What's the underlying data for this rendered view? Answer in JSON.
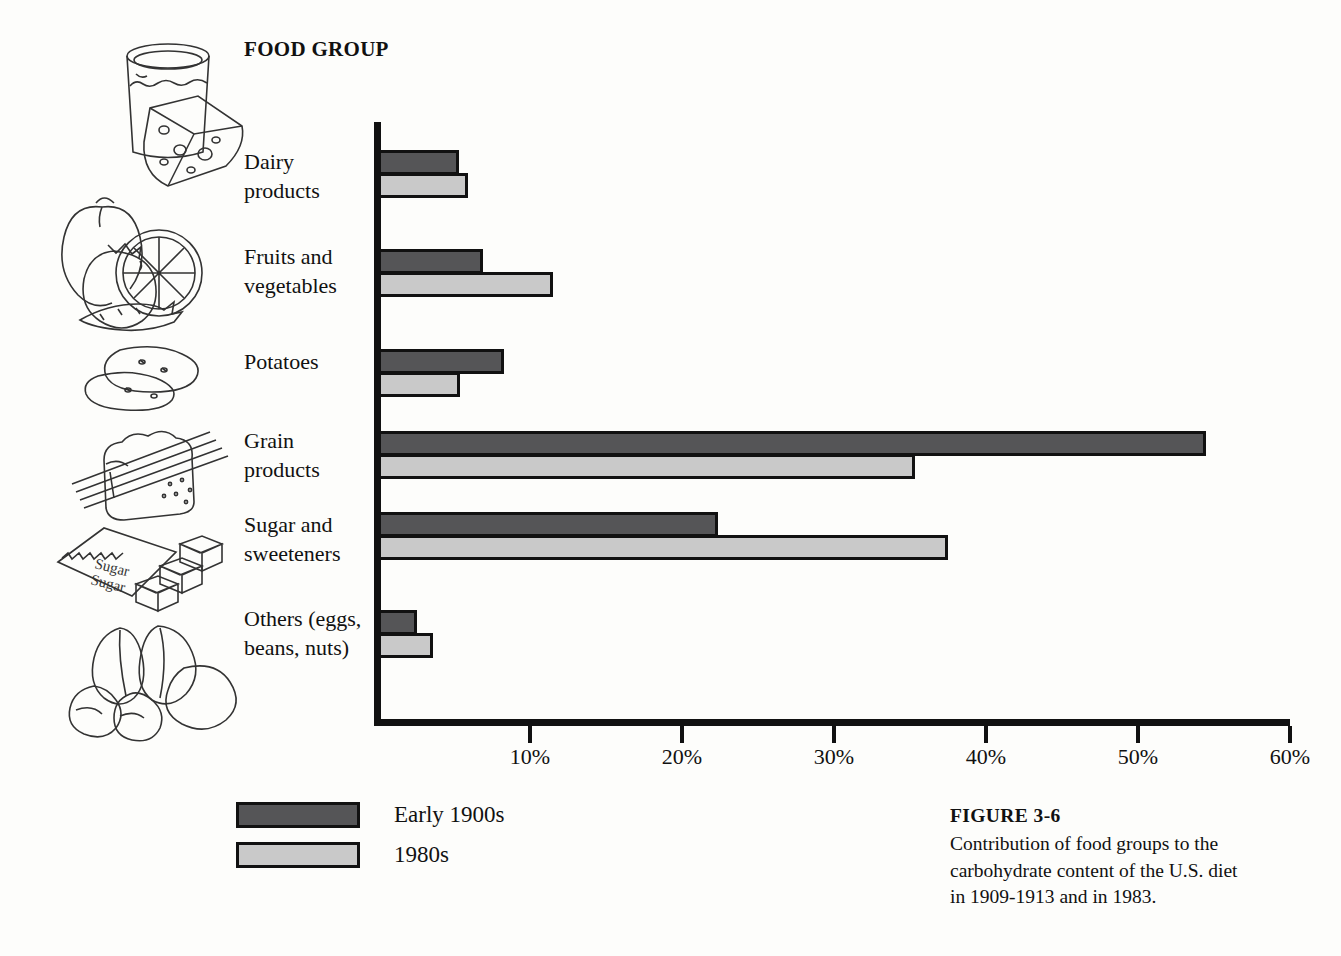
{
  "figure": {
    "number_label": "FIGURE 3-6",
    "caption": "Contribution of food groups to the carbohydrate content of the U.S. diet in 1909-1913 and in 1983."
  },
  "headings": {
    "food_group": "FOOD\nGROUP"
  },
  "axis": {
    "ticks": [
      {
        "value": 10,
        "label": "10%"
      },
      {
        "value": 20,
        "label": "20%"
      },
      {
        "value": 30,
        "label": "30%"
      },
      {
        "value": 40,
        "label": "40%"
      },
      {
        "value": 50,
        "label": "50%"
      },
      {
        "value": 60,
        "label": "60%"
      }
    ]
  },
  "legend": {
    "items": [
      {
        "label": "Early 1900s",
        "color": "#555557",
        "key": "early"
      },
      {
        "label": "1980s",
        "color": "#c9c9c9",
        "key": "eighties"
      }
    ]
  },
  "illustrations": [
    {
      "name": "dairy-illustration",
      "alt": "glass of milk and wedge of cheese"
    },
    {
      "name": "fruits-vegetables-illustration",
      "alt": "apple, tomato, orange slice and carrot"
    },
    {
      "name": "potatoes-illustration",
      "alt": "two potatoes"
    },
    {
      "name": "grain-illustration",
      "alt": "slice of bread with wheat stalks"
    },
    {
      "name": "sugar-illustration",
      "alt": "sugar packet with sugar cubes"
    },
    {
      "name": "others-illustration",
      "alt": "almonds, beans and cashew nuts"
    }
  ],
  "chart_data": {
    "type": "bar",
    "orientation": "horizontal",
    "title": "Contribution of food groups to the carbohydrate content of the U.S. diet",
    "xlabel": "",
    "ylabel": "FOOD GROUP",
    "xlim": [
      0,
      60
    ],
    "xtick_step": 10,
    "xtick_suffix": "%",
    "grid": false,
    "legend_position": "bottom-left",
    "categories": [
      "Dairy products",
      "Fruits and vegetables",
      "Potatoes",
      "Grain products",
      "Sugar and sweeteners",
      "Others (eggs, beans, nuts)"
    ],
    "series": [
      {
        "name": "Early 1900s",
        "color": "#555557",
        "values": [
          5.1,
          6.7,
          8.1,
          54.3,
          22.2,
          2.4
        ]
      },
      {
        "name": "1980s",
        "color": "#c9c9c9",
        "values": [
          5.7,
          11.3,
          5.2,
          35.1,
          37.3,
          3.4
        ]
      }
    ]
  }
}
